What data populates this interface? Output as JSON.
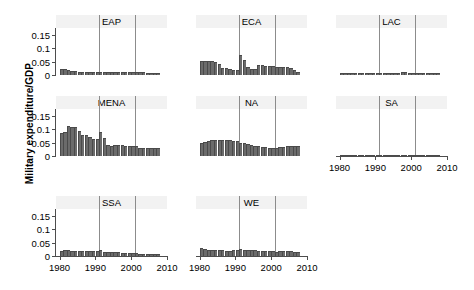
{
  "chart_data": {
    "type": "bar",
    "title": "",
    "xlabel": "",
    "ylabel": "Military expenditure/GDP",
    "ylim": [
      0,
      0.175
    ],
    "xlim": [
      1979,
      2010
    ],
    "grid": false,
    "legend": "none",
    "y_ticks": [
      "0",
      "0.05",
      "0.1",
      "0.15"
    ],
    "y_tick_values": [
      0,
      0.05,
      0.1,
      0.15
    ],
    "x_ticks": [
      "1980",
      "1990",
      "2000",
      "2010"
    ],
    "x_tick_values": [
      1980,
      1990,
      2000,
      2010
    ],
    "reference_lines": [
      1991,
      2001
    ],
    "bar_color": "#6b6b6b",
    "strip_color": "#f2f2f2",
    "axis_color": "#4d4d4d",
    "refline_color": "#8c8c8c",
    "x": [
      1980,
      1981,
      1982,
      1983,
      1984,
      1985,
      1986,
      1987,
      1988,
      1989,
      1990,
      1991,
      1992,
      1993,
      1994,
      1995,
      1996,
      1997,
      1998,
      1999,
      2000,
      2001,
      2002,
      2003,
      2004,
      2005,
      2006,
      2007
    ],
    "panels": [
      {
        "name": "EAP",
        "label": "EAP",
        "values": [
          0.021,
          0.022,
          0.019,
          0.016,
          0.014,
          0.012,
          0.012,
          0.011,
          0.011,
          0.011,
          0.011,
          0.011,
          0.011,
          0.011,
          0.011,
          0.011,
          0.011,
          0.011,
          0.011,
          0.011,
          0.011,
          0.011,
          0.011,
          0.01,
          0.009,
          0.008,
          0.007,
          0.007
        ]
      },
      {
        "name": "ECA",
        "label": "ECA",
        "values": [
          0.051,
          0.053,
          0.052,
          0.051,
          0.047,
          0.04,
          0.026,
          0.025,
          0.022,
          0.019,
          0.017,
          0.073,
          0.057,
          0.03,
          0.023,
          0.021,
          0.038,
          0.037,
          0.035,
          0.033,
          0.032,
          0.03,
          0.029,
          0.029,
          0.028,
          0.026,
          0.018,
          0.012
        ]
      },
      {
        "name": "LAC",
        "label": "LAC",
        "values": [
          0.008,
          0.008,
          0.008,
          0.007,
          0.007,
          0.006,
          0.006,
          0.006,
          0.006,
          0.006,
          0.006,
          0.006,
          0.006,
          0.006,
          0.007,
          0.008,
          0.009,
          0.01,
          0.01,
          0.009,
          0.009,
          0.009,
          0.008,
          0.008,
          0.007,
          0.007,
          0.007,
          0.007
        ]
      },
      {
        "name": "MENA",
        "label": "MENA",
        "values": [
          0.085,
          0.09,
          0.11,
          0.107,
          0.108,
          0.095,
          0.08,
          0.079,
          0.071,
          0.065,
          0.063,
          0.088,
          0.067,
          0.042,
          0.037,
          0.04,
          0.04,
          0.04,
          0.039,
          0.039,
          0.039,
          0.037,
          0.029,
          0.029,
          0.03,
          0.031,
          0.031,
          0.031
        ]
      },
      {
        "name": "NA",
        "label": "NA",
        "values": [
          0.049,
          0.051,
          0.055,
          0.058,
          0.059,
          0.06,
          0.06,
          0.06,
          0.058,
          0.057,
          0.055,
          0.049,
          0.048,
          0.045,
          0.042,
          0.039,
          0.036,
          0.034,
          0.032,
          0.031,
          0.03,
          0.03,
          0.032,
          0.035,
          0.036,
          0.036,
          0.036,
          0.036
        ]
      },
      {
        "name": "SA",
        "label": "SA",
        "values": [
          0.004,
          0.003,
          0.004,
          0.003,
          0.004,
          0.003,
          0.004,
          0.003,
          0.004,
          0.003,
          0.004,
          0.003,
          0.003,
          0.003,
          0.003,
          0.003,
          0.003,
          0.003,
          0.003,
          0.003,
          0.003,
          0.003,
          0.003,
          0.003,
          0.003,
          0.003,
          0.003,
          0.003
        ]
      },
      {
        "name": "SSA",
        "label": "SSA",
        "values": [
          0.02,
          0.022,
          0.021,
          0.019,
          0.018,
          0.017,
          0.017,
          0.017,
          0.018,
          0.019,
          0.02,
          0.021,
          0.016,
          0.015,
          0.015,
          0.014,
          0.014,
          0.013,
          0.013,
          0.012,
          0.011,
          0.01,
          0.007,
          0.007,
          0.007,
          0.007,
          0.007,
          0.007
        ]
      },
      {
        "name": "WE",
        "label": "WE",
        "values": [
          0.029,
          0.026,
          0.024,
          0.023,
          0.022,
          0.021,
          0.021,
          0.02,
          0.02,
          0.021,
          0.022,
          0.026,
          0.023,
          0.023,
          0.022,
          0.021,
          0.02,
          0.019,
          0.018,
          0.018,
          0.017,
          0.016,
          0.017,
          0.017,
          0.017,
          0.017,
          0.016,
          0.016
        ]
      }
    ]
  }
}
